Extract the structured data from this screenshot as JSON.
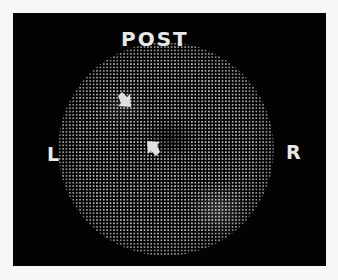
{
  "image": {
    "type": "scan",
    "labels": {
      "top": "POST",
      "left": "L",
      "right": "R"
    },
    "annotations": [
      {
        "type": "arrow",
        "direction": "down-right"
      },
      {
        "type": "arrow",
        "direction": "up-left"
      }
    ],
    "colors": {
      "background": "#030303",
      "dots": "#d8d8d8",
      "label": "#e8e8e8",
      "page": "#f7f7f5"
    }
  }
}
